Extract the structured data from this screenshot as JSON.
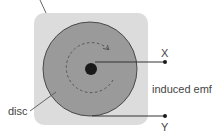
{
  "diagram": {
    "labels": {
      "disc": "disc",
      "terminal_x": "X",
      "terminal_y": "Y",
      "induced_emf": "induced emf"
    },
    "colors": {
      "background_square": "#d9d9d9",
      "disc_fill": "#9a9a9a",
      "disc_stroke": "#555555",
      "hub": "#1a1a1a",
      "wire": "#333333",
      "dashed_arrow": "#555555",
      "label_text": "#444444",
      "leader_line": "#555555"
    }
  }
}
